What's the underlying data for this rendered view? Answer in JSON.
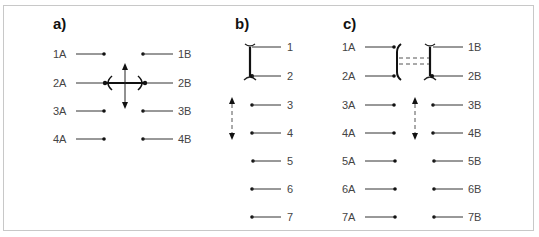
{
  "panels": {
    "a": {
      "title": "a)",
      "left_labels": [
        "1A",
        "2A",
        "3A",
        "4A"
      ],
      "right_labels": [
        "1B",
        "2B",
        "3B",
        "4B"
      ],
      "annotation": "four-way arrow between 2A and 2B terminals"
    },
    "b": {
      "title": "b)",
      "labels": [
        "1",
        "2",
        "3",
        "4",
        "5",
        "6",
        "7"
      ],
      "annotation": "terminals 1 and 2 bridged; dashed vertical double arrow at 3-4"
    },
    "c": {
      "title": "c)",
      "left_labels": [
        "1A",
        "2A",
        "3A",
        "4A",
        "5A",
        "6A",
        "7A"
      ],
      "right_labels": [
        "1B",
        "2B",
        "3B",
        "4B",
        "5B",
        "6B",
        "7B"
      ],
      "annotation": "1A-2A and 1B-2B bridged with dashed double-line link; dashed vertical double arrow at 3-4"
    }
  },
  "colors": {
    "border": "#c8c8c8",
    "line": "#333333",
    "text": "#444444"
  }
}
